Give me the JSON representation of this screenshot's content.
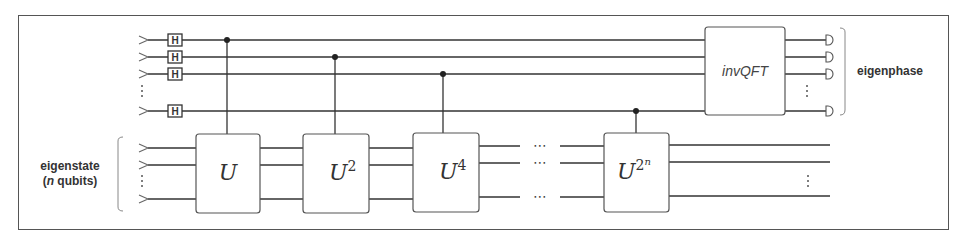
{
  "diagram": {
    "labels": {
      "eigenstate_line1": "eigenstate",
      "eigenstate_line2_prefix": "(",
      "eigenstate_line2_italic": "n",
      "eigenstate_line2_suffix": " qubits)",
      "eigenphase": "eigenphase"
    },
    "hadamard_label": "H",
    "gates": [
      {
        "name": "U",
        "base": "U",
        "exponent": ""
      },
      {
        "name": "U^2",
        "base": "U",
        "exponent": "2"
      },
      {
        "name": "U^4",
        "base": "U",
        "exponent": "4"
      },
      {
        "name": "U^(2^n)",
        "base": "U",
        "exponent": "2",
        "exponent_sup": "n"
      }
    ],
    "inverse_qft_label": "invQFT",
    "ellipsis_horizontal": "⋯",
    "ellipsis_vertical": "⋮",
    "ancilla_register": {
      "visible_wires": 4,
      "has_hadamard": true,
      "measured": true
    },
    "eigenstate_register": {
      "visible_wires": 3
    },
    "colors": {
      "line": "#333333",
      "frame": "#555555",
      "text": "#333333"
    }
  }
}
